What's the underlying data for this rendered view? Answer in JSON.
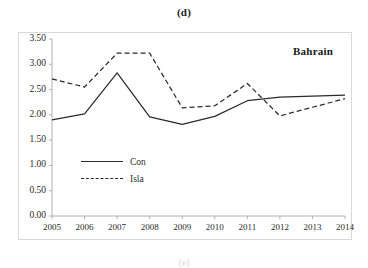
{
  "figure": {
    "panel_title": "(d)",
    "country_label": "Bahrain",
    "footer_note": "(e)"
  },
  "legend": {
    "entries": [
      {
        "label": "Con",
        "style": "solid"
      },
      {
        "label": "Isla",
        "style": "dashed"
      }
    ]
  },
  "axes": {
    "y_ticks": [
      "0.00",
      "0.50",
      "1.00",
      "1.50",
      "2.00",
      "2.50",
      "3.00",
      "3.50"
    ],
    "x_ticks": [
      "2005",
      "2006",
      "2007",
      "2008",
      "2009",
      "2010",
      "2011",
      "2012",
      "2013",
      "2014"
    ]
  },
  "chart_data": {
    "type": "line",
    "title": "(d)",
    "annotation": "Bahrain",
    "xlabel": "",
    "ylabel": "",
    "x": [
      2005,
      2006,
      2007,
      2008,
      2009,
      2010,
      2011,
      2012,
      2013,
      2014
    ],
    "categories": [
      "2005",
      "2006",
      "2007",
      "2008",
      "2009",
      "2010",
      "2011",
      "2012",
      "2013",
      "2014"
    ],
    "ylim": [
      0.0,
      3.5
    ],
    "ytick_step": 0.5,
    "grid": false,
    "legend_position": "inside-left",
    "series": [
      {
        "name": "Con",
        "style": "solid",
        "color": "#2b2b2b",
        "values": [
          1.9,
          2.02,
          2.83,
          1.96,
          1.81,
          1.97,
          2.28,
          2.35,
          2.37,
          2.39
        ]
      },
      {
        "name": "Isla",
        "style": "dashed",
        "color": "#2b2b2b",
        "values": [
          2.71,
          2.55,
          3.22,
          3.22,
          2.14,
          2.18,
          2.62,
          1.98,
          2.15,
          2.32
        ]
      }
    ]
  }
}
